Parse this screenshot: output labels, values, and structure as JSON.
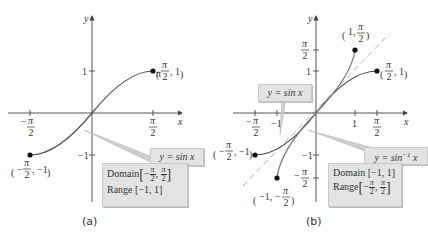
{
  "figure": {
    "panels": [
      {
        "id": "a",
        "caption": "(a)",
        "axes": {
          "x_label": "x",
          "y_label": "y",
          "x_ticks": [
            "-π/2",
            "π/2"
          ],
          "y_ticks": [
            "1",
            "-1"
          ]
        },
        "curve_label": "y = sin x",
        "endpoints": [
          "(π/2, 1)",
          "(-π/2, -1)"
        ],
        "info": {
          "domain_label": "Domain",
          "domain": "[-π/2, π/2]",
          "range_label": "Range",
          "range": "[-1, 1]"
        }
      },
      {
        "id": "b",
        "caption": "(b)",
        "axes": {
          "x_label": "x",
          "y_label": "y",
          "x_ticks": [
            "-π/2",
            "-1",
            "1",
            "π/2"
          ],
          "y_ticks": [
            "π/2",
            "1",
            "-1",
            "-π/2"
          ]
        },
        "curve_labels": [
          "y = sin x",
          "y = sin⁻¹ x"
        ],
        "endpoints": [
          "(1, π/2)",
          "(π/2, 1)",
          "(-π/2, -1)",
          "(-1, -π/2)"
        ],
        "reference_line": "y = x (dashed)",
        "info": {
          "domain_label": "Domain",
          "domain": "[-1, 1]",
          "range_label": "Range",
          "range": "[-π/2, π/2]"
        }
      }
    ],
    "text": {
      "x": "x",
      "y": "y",
      "pi": "π",
      "two": "2",
      "one": "1",
      "neg_one": "−1",
      "minus": "−",
      "neg1_label": "−1",
      "ysinx": "y = sin x",
      "ysininv_y": "y = sin",
      "ysininv_sup": "−1",
      "ysininv_x": " x",
      "domain": "Domain",
      "range": "Range",
      "range_a": "[−1, 1]",
      "domain_b": "[−1, 1]",
      "cap_a": "(a)",
      "cap_b": "(b)"
    }
  },
  "colors": {
    "curve": "#555555",
    "axis": "#444444",
    "callout": "#e3e3e3",
    "leader": "#b5b5b5",
    "dashed": "#b0b0b0"
  }
}
